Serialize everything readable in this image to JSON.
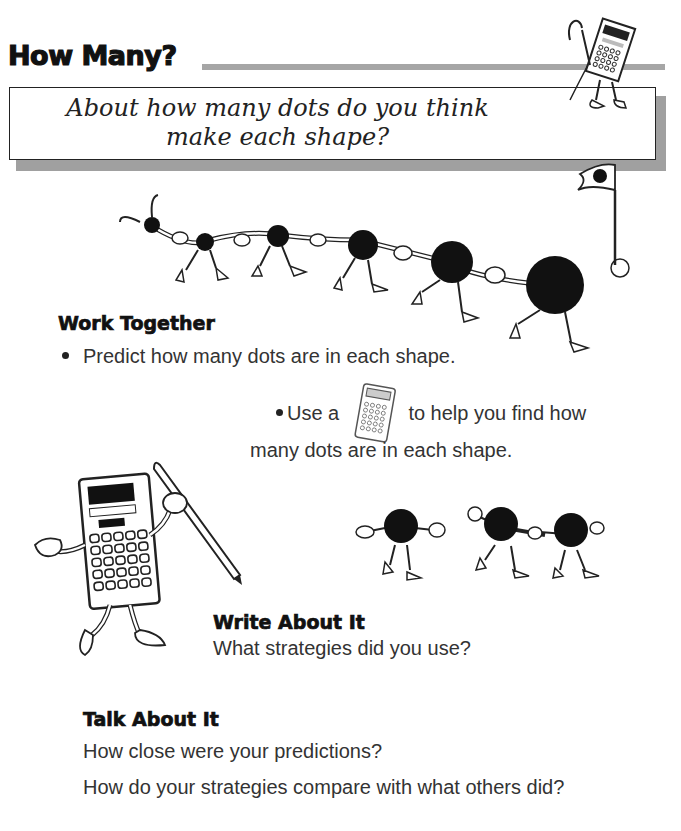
{
  "page": {
    "title": "How Many?",
    "question_line1": "About how many dots do you think",
    "question_line2": "make each shape?"
  },
  "work_together": {
    "heading": "Work Together",
    "bullet1": "Predict how many dots are in each shape.",
    "bullet2_part1": "Use a",
    "bullet2_icon": "calculator-icon",
    "bullet2_part2": "to help you find how",
    "bullet2_line2": "many dots are in each shape."
  },
  "write_about_it": {
    "heading": "Write About It",
    "prompt": "What strategies did you use?"
  },
  "talk_about_it": {
    "heading": "Talk About It",
    "prompt1": "How close were your predictions?",
    "prompt2": "How do your strategies compare with what others did?"
  },
  "illustrations": {
    "top_right": "calculator-mascot-icon",
    "dot_parade": "dot-characters-parade-icon",
    "flag": "flag-icon",
    "left": "calculator-with-pencil-icon",
    "small_dots": "dot-characters-small-icon"
  },
  "colors": {
    "shadow": "#a0a0a0",
    "rule": "#a6a6a6",
    "ink": "#111111"
  }
}
